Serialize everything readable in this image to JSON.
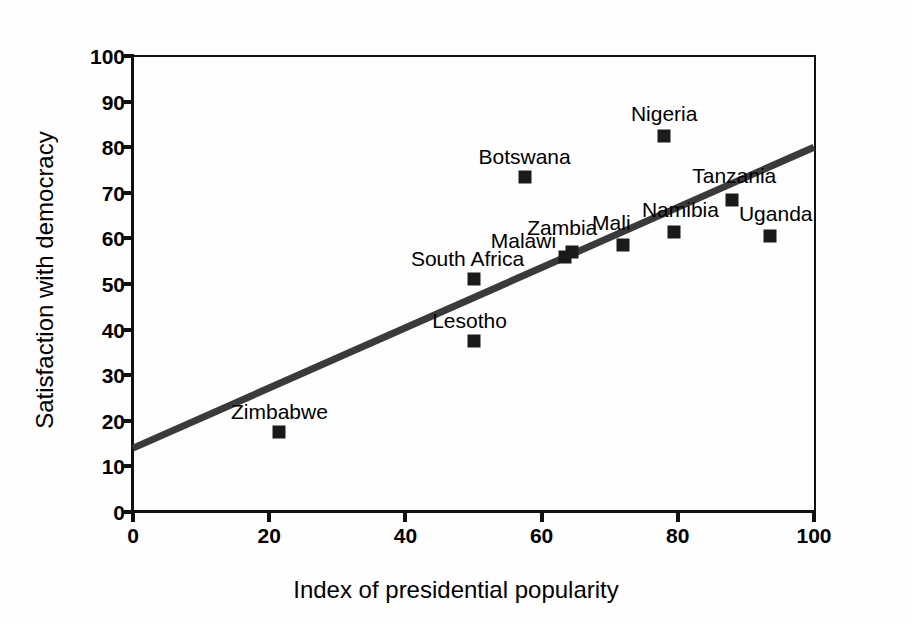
{
  "chart_data": {
    "type": "scatter",
    "title": "",
    "xlabel": "Index of presidential popularity",
    "ylabel": "Satisfaction with democracy",
    "xlim": [
      0,
      100
    ],
    "ylim": [
      0,
      100
    ],
    "xticks": [
      0,
      20,
      40,
      60,
      80,
      100
    ],
    "yticks": [
      0,
      10,
      20,
      30,
      40,
      50,
      60,
      70,
      80,
      90,
      100
    ],
    "grid": false,
    "legend": null,
    "marker_color": "#1a1a1a",
    "trendline_color": "#3a3a3a",
    "points": [
      {
        "label": "Zimbabwe",
        "x": 21.5,
        "y": 17.5,
        "label_dx": 0,
        "label_dy": -10
      },
      {
        "label": "Lesotho",
        "x": 50.0,
        "y": 37.5,
        "label_dx": -4,
        "label_dy": -10
      },
      {
        "label": "South Africa",
        "x": 50.0,
        "y": 51.0,
        "label_dx": -6,
        "label_dy": -10
      },
      {
        "label": "Botswana",
        "x": 57.5,
        "y": 73.5,
        "label_dx": 0,
        "label_dy": -10
      },
      {
        "label": "Malawi",
        "x": 63.5,
        "y": 56.0,
        "label_dx": -42,
        "label_dy": -6
      },
      {
        "label": "Zambia",
        "x": 64.5,
        "y": 57.0,
        "label_dx": -10,
        "label_dy": -14
      },
      {
        "label": "Mali",
        "x": 72.0,
        "y": 58.5,
        "label_dx": -12,
        "label_dy": -12
      },
      {
        "label": "Nigeria",
        "x": 78.0,
        "y": 82.5,
        "label_dx": 0,
        "label_dy": -12
      },
      {
        "label": "Namibia",
        "x": 79.5,
        "y": 61.5,
        "label_dx": 6,
        "label_dy": -12
      },
      {
        "label": "Tanzania",
        "x": 88.0,
        "y": 68.5,
        "label_dx": 2,
        "label_dy": -14
      },
      {
        "label": "Uganda",
        "x": 93.5,
        "y": 60.5,
        "label_dx": 6,
        "label_dy": -12
      }
    ],
    "trendline": {
      "x0": 0,
      "y0": 14,
      "x1": 100,
      "y1": 80
    }
  },
  "axes": {
    "x_title": "Index of presidential popularity",
    "y_title": "Satisfaction with democracy"
  }
}
